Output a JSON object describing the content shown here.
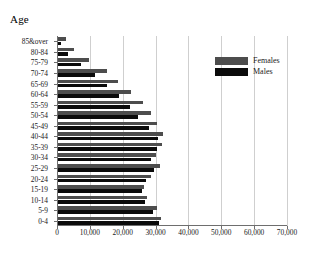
{
  "chart_data": {
    "type": "bar",
    "orientation": "horizontal",
    "title": "Age",
    "xlabel": "",
    "ylabel": "Age",
    "xlim": [
      0,
      70000
    ],
    "grid": true,
    "legend_position": "upper-right",
    "xticks": [
      "0",
      "10,000",
      "20,000",
      "30,000",
      "40,000",
      "50,000",
      "60,000",
      "70,000"
    ],
    "xtick_values": [
      0,
      10000,
      20000,
      30000,
      40000,
      50000,
      60000,
      70000
    ],
    "categories": [
      "85&over",
      "80-84",
      "75-79",
      "70-74",
      "65-69",
      "60-64",
      "55-59",
      "50-54",
      "45-49",
      "40-44",
      "35-39",
      "30-34",
      "25-29",
      "20-24",
      "15-19",
      "10-14",
      "5-9",
      "0-4"
    ],
    "series": [
      {
        "name": "Females",
        "color": "#4d4d4d",
        "values": [
          2800,
          5300,
          9700,
          15300,
          18700,
          22600,
          26100,
          28500,
          30400,
          32300,
          31900,
          30000,
          31400,
          28700,
          26400,
          27400,
          30400,
          31800
        ]
      },
      {
        "name": "Males",
        "color": "#0b0b0b",
        "values": [
          1300,
          3200,
          7200,
          11600,
          15100,
          19000,
          22300,
          24800,
          28100,
          30700,
          30300,
          28500,
          29600,
          27200,
          25800,
          26900,
          29200,
          30900
        ]
      }
    ]
  },
  "legend": {
    "items": [
      {
        "label": "Females",
        "swatch": "female"
      },
      {
        "label": "Males",
        "swatch": "male"
      }
    ]
  }
}
